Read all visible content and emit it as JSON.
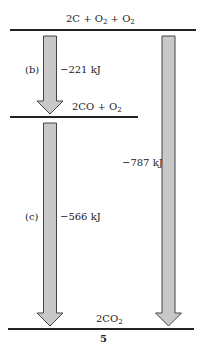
{
  "diagram": {
    "type": "enthalpy-level-diagram",
    "figure_number": "5",
    "levels": [
      {
        "id": "top",
        "label_main": "2C + O",
        "label_sub1": "2",
        "label_mid": " + O",
        "label_sub2": "2"
      },
      {
        "id": "middle",
        "label_main": "2CO + O",
        "label_sub1": "2"
      },
      {
        "id": "bottom",
        "label_main": "2CO",
        "label_sub1": "2"
      }
    ],
    "arrows": [
      {
        "id": "b",
        "tag": "(b)",
        "energy": "−221 kJ",
        "from": "top",
        "to": "middle"
      },
      {
        "id": "c",
        "tag": "(c)",
        "energy": "−566 kJ",
        "from": "middle",
        "to": "bottom"
      },
      {
        "id": "total",
        "tag": "",
        "energy": "−787 kJ",
        "from": "top",
        "to": "bottom"
      }
    ],
    "colors": {
      "arrow_fill": "#c8c8c8",
      "arrow_stroke": "#444444",
      "line": "#222222"
    }
  }
}
